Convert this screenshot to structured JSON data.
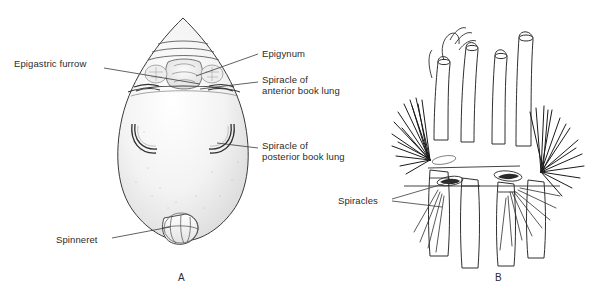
{
  "figure": {
    "type": "labeled-biological-line-drawing",
    "background_color": "#ffffff",
    "ink_color": "#2b2b2b",
    "shading_color": "#d8d8d8"
  },
  "panels": [
    {
      "id": "A",
      "letter": "A",
      "x": 178,
      "y": 278,
      "caption": "Ventral view of spider abdomen"
    },
    {
      "id": "B",
      "letter": "B",
      "x": 495,
      "y": 278,
      "caption": "Spinnerets and spiracles detail"
    }
  ],
  "labels": [
    {
      "id": "epigastric-furrow",
      "text": "Epigastric furrow",
      "x": 14,
      "y": 58,
      "panel": "A",
      "align": "left",
      "leader": [
        [
          104,
          68
        ],
        [
          200,
          82
        ]
      ]
    },
    {
      "id": "epigynum",
      "text": "Epigynum",
      "x": 262,
      "y": 48,
      "panel": "A",
      "align": "left",
      "leader": [
        [
          258,
          54
        ],
        [
          196,
          76
        ]
      ]
    },
    {
      "id": "spiracle-anterior-book-lung",
      "line1": "Spiracle of",
      "line2": "anterior book lung",
      "text": "Spiracle of anterior book lung",
      "x": 262,
      "y": 74,
      "panel": "A",
      "align": "left",
      "leader": [
        [
          258,
          82
        ],
        [
          200,
          88
        ]
      ]
    },
    {
      "id": "spiracle-posterior-book-lung",
      "line1": "Spiracle of",
      "line2": "posterior book lung",
      "text": "Spiracle of posterior book lung",
      "x": 262,
      "y": 140,
      "panel": "A",
      "align": "left",
      "leader": [
        [
          258,
          148
        ],
        [
          216,
          142
        ]
      ]
    },
    {
      "id": "spinneret",
      "text": "Spinneret",
      "x": 56,
      "y": 234,
      "panel": "A",
      "align": "left",
      "leader": [
        [
          112,
          238
        ],
        [
          170,
          228
        ]
      ]
    },
    {
      "id": "spiracles",
      "text": "Spiracles",
      "x": 338,
      "y": 195,
      "panel": "B",
      "align": "left",
      "leader_a": [
        [
          392,
          199
        ],
        [
          448,
          183
        ]
      ],
      "leader_b": [
        [
          392,
          201
        ],
        [
          444,
          206
        ]
      ]
    }
  ],
  "panel_a_anatomy": {
    "abdomen_outline": "teardrop/ovoid ventral abdomen, apex up",
    "features": [
      "transverse ridged band (epigastric plate) at top",
      "epigynum plate with stippled texture",
      "paired anterior book lung spiracle slits below epigastric furrow",
      "paired crescent posterior book lung spiracles mid-abdomen",
      "spinneret cluster at bottom apex"
    ]
  },
  "panel_b_anatomy": {
    "features": [
      "four upright tubular spinnerets with open tips",
      "dense black bristle (seta) tufts on left and right",
      "oval spiracle openings with dark shading",
      "horizontal ridge lines across base segments",
      "branching setae at lower right"
    ]
  }
}
